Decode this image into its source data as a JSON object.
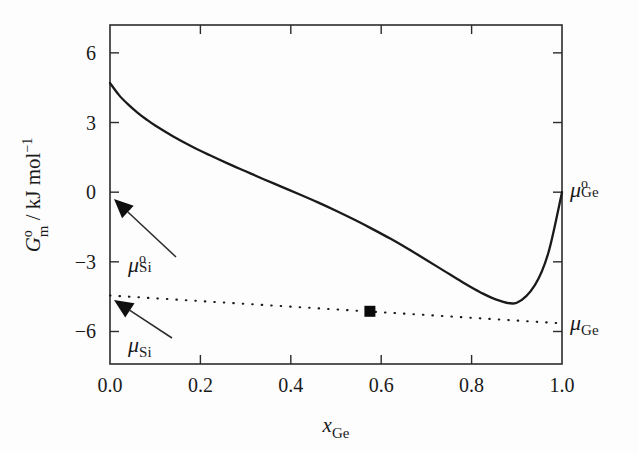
{
  "figure": {
    "background": "#fdfdfd",
    "ink_color": "#1a1a1a"
  },
  "axis_titles": {
    "x_main": "x",
    "x_sub": "Ge",
    "y_main": "G",
    "y_sup": "o",
    "y_sub": "m",
    "y_units": " / kJ mol",
    "y_units_sup": "−1"
  },
  "ticks": {
    "x_labels": [
      "0.0",
      "0.2",
      "0.4",
      "0.6",
      "0.8",
      "1.0"
    ],
    "x_values": [
      0.0,
      0.2,
      0.4,
      0.6,
      0.8,
      1.0
    ],
    "y_labels": [
      "6",
      "3",
      "0",
      "−3",
      "−6"
    ],
    "y_values": [
      6,
      3,
      0,
      -3,
      -6
    ]
  },
  "annotations": [
    {
      "id": "mu-si-standard",
      "mu": "μ",
      "sup": "o",
      "sub": "Si",
      "label_x": 128,
      "label_y": 272,
      "arrow_from_x": 176,
      "arrow_from_y": 257,
      "arrow_to_x": 114,
      "arrow_to_y": 199,
      "points_to_value": 0.0
    },
    {
      "id": "mu-si-partial",
      "mu": "μ",
      "sup": "",
      "sub": "Si",
      "label_x": 128,
      "label_y": 352,
      "arrow_from_x": 172,
      "arrow_from_y": 338,
      "arrow_to_x": 114,
      "arrow_to_y": 300,
      "points_to_value": -4.45
    },
    {
      "id": "mu-ge-standard",
      "mu": "μ",
      "sup": "o",
      "sub": "Ge",
      "label_x": 570,
      "label_y": 197,
      "arrow_from_x": null,
      "arrow_from_y": null,
      "arrow_to_x": null,
      "arrow_to_y": null,
      "points_to_value": 0.0
    },
    {
      "id": "mu-ge-partial",
      "mu": "μ",
      "sup": "",
      "sub": "Ge",
      "label_x": 570,
      "label_y": 330,
      "arrow_from_x": null,
      "arrow_from_y": null,
      "arrow_to_x": null,
      "arrow_to_y": null,
      "points_to_value": -5.65
    }
  ],
  "chart_data": {
    "type": "line",
    "title": "",
    "xlabel": "x_Ge",
    "ylabel": "G_m^o / kJ mol^-1",
    "xlim": [
      0.0,
      1.0
    ],
    "ylim": [
      -7.4,
      7.2
    ],
    "grid": false,
    "legend": "none",
    "series": [
      {
        "name": "G_m^o(mixture)",
        "style": "solid",
        "x": [
          0.0,
          0.02,
          0.04,
          0.06,
          0.08,
          0.1,
          0.14,
          0.18,
          0.22,
          0.26,
          0.3,
          0.34,
          0.38,
          0.42,
          0.46,
          0.5,
          0.54,
          0.58,
          0.62,
          0.66,
          0.7,
          0.74,
          0.78,
          0.82,
          0.86,
          0.9,
          0.94,
          0.97,
          1.0
        ],
        "y": [
          4.7,
          4.18,
          3.78,
          3.44,
          3.14,
          2.87,
          2.4,
          1.98,
          1.6,
          1.24,
          0.9,
          0.56,
          0.23,
          -0.1,
          -0.44,
          -0.8,
          -1.18,
          -1.58,
          -2.0,
          -2.45,
          -2.92,
          -3.4,
          -3.88,
          -4.32,
          -4.66,
          -4.76,
          -4.0,
          -2.6,
          0.0
        ]
      },
      {
        "name": "common tangent",
        "style": "dotted",
        "x": [
          0.0,
          1.0
        ],
        "y": [
          -4.45,
          -5.65
        ]
      }
    ],
    "markers": [
      {
        "name": "tangent-point",
        "shape": "square",
        "x": 0.575,
        "y": -5.13
      }
    ]
  }
}
